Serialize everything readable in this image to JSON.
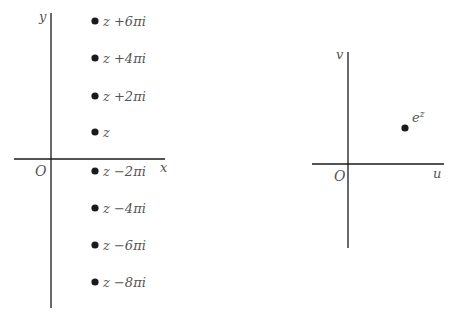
{
  "left_plane": {
    "x_axis_label": "x",
    "y_axis_label": "y",
    "origin_label": "O",
    "points": [
      {
        "label": "z +6πi",
        "y": 21
      },
      {
        "label": "z +4πi",
        "y": 58
      },
      {
        "label": "z +2πi",
        "y": 96
      },
      {
        "label": "z",
        "y": 132
      },
      {
        "label": "z −2πi",
        "y": 171
      },
      {
        "label": "z −4πi",
        "y": 208
      },
      {
        "label": "z −6πi",
        "y": 245
      },
      {
        "label": "z −8πi",
        "y": 282
      }
    ]
  },
  "right_plane": {
    "u_axis_label": "u",
    "v_axis_label": "v",
    "origin_label": "O",
    "point_label": "e",
    "point_label_sup": "z"
  },
  "colors": {
    "ink": "#1a1a1a",
    "label": "#555555"
  }
}
